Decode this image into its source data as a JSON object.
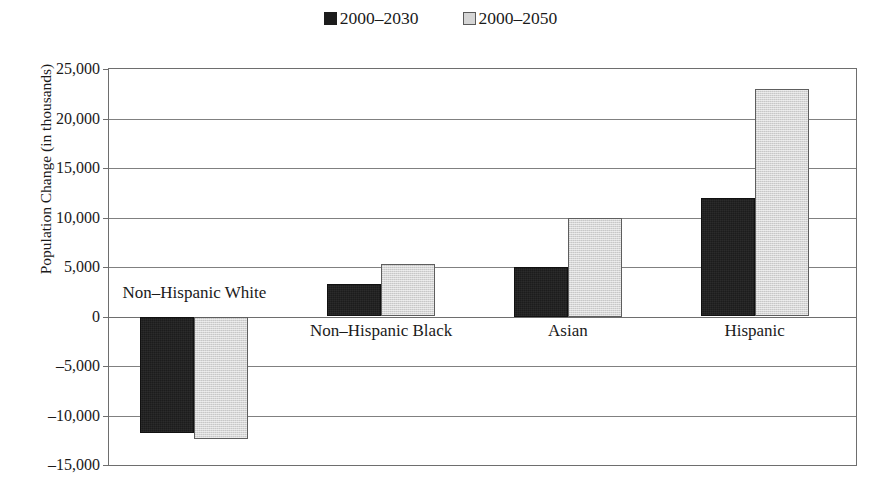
{
  "chart_data": {
    "type": "bar",
    "title": "",
    "xlabel": "",
    "ylabel": "Population Change (in thousands)",
    "categories": [
      "Non–Hispanic White",
      "Non–Hispanic Black",
      "Asian",
      "Hispanic"
    ],
    "series": [
      {
        "name": "2000–2030",
        "values": [
          -11800,
          3300,
          5000,
          12000
        ]
      },
      {
        "name": "2000–2050",
        "values": [
          -12400,
          5300,
          10000,
          23000
        ]
      }
    ],
    "ylim": [
      -15000,
      25000
    ],
    "ytick_labels": [
      "25,000",
      "20,000",
      "15,000",
      "10,000",
      "5,000",
      "0",
      "–5,000",
      "–10,000",
      "–15,000"
    ],
    "ytick_values": [
      25000,
      20000,
      15000,
      10000,
      5000,
      0,
      -5000,
      -10000,
      -15000
    ],
    "grid": true,
    "legend_position": "top-center",
    "colors": {
      "series_2000_2030": "#1c1c1c",
      "series_2000_2050": "#d6d6d6",
      "axis": "#6e6e6e",
      "gridline": "#808080",
      "background": "#ffffff",
      "text": "#1a1a1a"
    }
  },
  "legend": {
    "entries": [
      {
        "label": "2000–2030",
        "swatch": "dark-filled-square"
      },
      {
        "label": "2000–2050",
        "swatch": "light-gray-square"
      }
    ]
  },
  "axis": {
    "y_title": "Population Change (in thousands)"
  }
}
